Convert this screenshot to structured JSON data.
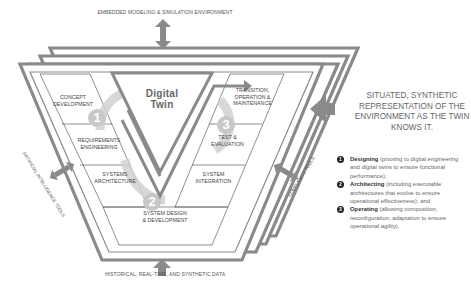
{
  "top_label": "Embedded Modeling & Simulation Environment",
  "bottom_label": "Historical, Real-Time, and Synthetic Data",
  "left_label": "Artificial Intelligence Tools",
  "right_label": "Complexity Tools",
  "center": {
    "line1": "Digital",
    "line2": "Twin"
  },
  "phases_left": [
    {
      "line1": "Concept",
      "line2": "Development"
    },
    {
      "line1": "Requirements",
      "line2": "Engineering"
    },
    {
      "line1": "Systems",
      "line2": "Architecture"
    }
  ],
  "phase_bottom": {
    "line1": "System Design",
    "line2": "& Development"
  },
  "phases_right": [
    {
      "line1": "Transition,",
      "line2": "Operation &",
      "line3": "Maintenance"
    },
    {
      "line1": "Test &",
      "line2": "Evaluation"
    },
    {
      "line1": "System",
      "line2": "Integration"
    }
  ],
  "circle_numbers": [
    "1",
    "2",
    "3"
  ],
  "situated_text": "Situated, synthetic representation of the environment as the twin knows it.",
  "legend": [
    {
      "num": "1",
      "title": "Designing",
      "desc": " (pivoting to digital engineering and digital twins to ensure functional performance);"
    },
    {
      "num": "2",
      "title": "Architecting",
      "desc": " (including executable architectures that evolve to ensure operational effectiveness); and"
    },
    {
      "num": "3",
      "title": "Operating",
      "desc": " (allowing composition, reconfiguration, adaptation to ensure operational agility)."
    }
  ],
  "colors": {
    "frame": "#8a8a8a",
    "arrow": "#7a7a7a",
    "circle": "#cfcfcf",
    "legend_bullet": "#222222"
  }
}
